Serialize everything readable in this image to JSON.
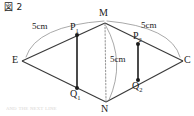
{
  "figure": {
    "caption": "図 2",
    "type": "geometry-diagram",
    "shape": "rhombus with two vertical chords and a dotted vertical diagonal",
    "colors": {
      "background": "#ffffff",
      "stroke": "#3a3a3a",
      "chord_stroke": "#2b2b2b",
      "arc_stroke": "#8c8c8c",
      "dotted_stroke": "#9a9a9a",
      "text": "#1a1a1a"
    },
    "vertices": [
      {
        "id": "M",
        "label": "M",
        "sub": "",
        "x": 105,
        "y": 23,
        "dot": false
      },
      {
        "id": "E",
        "label": "E",
        "sub": "",
        "x": 22,
        "y": 61,
        "dot": false
      },
      {
        "id": "C",
        "label": "C",
        "sub": "",
        "x": 183,
        "y": 61,
        "dot": false
      },
      {
        "id": "N",
        "label": "N",
        "sub": "",
        "x": 106,
        "y": 102,
        "dot": false
      },
      {
        "id": "P1",
        "label": "P",
        "sub": "1",
        "x": 77,
        "y": 35,
        "dot": true
      },
      {
        "id": "Q1",
        "label": "Q",
        "sub": "1",
        "x": 77,
        "y": 88,
        "dot": true
      },
      {
        "id": "P2",
        "label": "P",
        "sub": "2",
        "x": 138,
        "y": 44,
        "dot": true
      },
      {
        "id": "Q2",
        "label": "Q",
        "sub": "2",
        "x": 138,
        "y": 80,
        "dot": true
      }
    ],
    "edges": [
      {
        "from": "E",
        "to": "M",
        "style": "solid"
      },
      {
        "from": "M",
        "to": "C",
        "style": "solid"
      },
      {
        "from": "C",
        "to": "N",
        "style": "solid"
      },
      {
        "from": "N",
        "to": "E",
        "style": "solid"
      },
      {
        "from": "M",
        "to": "N",
        "style": "dotted"
      },
      {
        "from": "P1",
        "to": "Q1",
        "style": "solid-thick"
      },
      {
        "from": "P2",
        "to": "Q2",
        "style": "solid-thick"
      }
    ],
    "measurements": [
      {
        "id": "left",
        "text": "5cm",
        "x": 32,
        "y": 27,
        "spans": "E to M arc"
      },
      {
        "id": "right",
        "text": "5cm",
        "x": 141,
        "y": 25,
        "spans": "M to C arc"
      },
      {
        "id": "middle",
        "text": "5cm",
        "x": 110,
        "y": 58,
        "spans": "M to N arc"
      }
    ],
    "ghost_text": "ᴀɴᴅ ᴛʜᴇ ɴᴇxᴛ ʟɪɴᴇ"
  }
}
